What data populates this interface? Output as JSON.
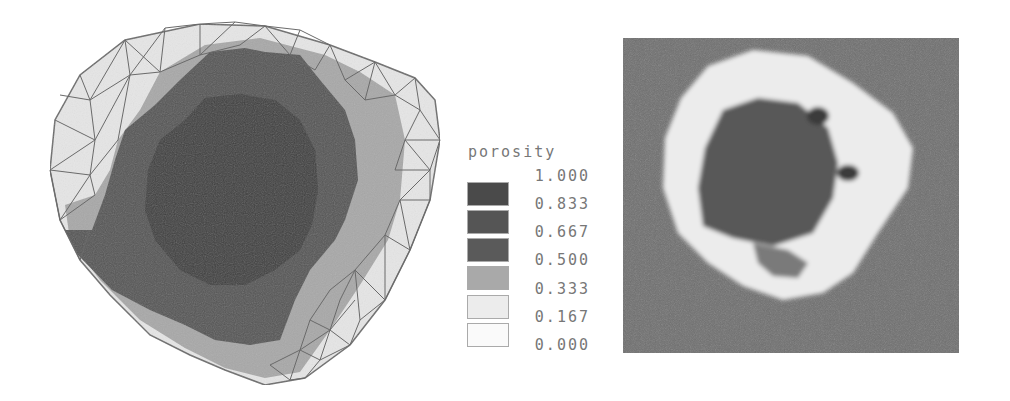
{
  "figure": {
    "left_panel": {
      "description": "Finite element mesh contour plot of porosity in a bone cross-section",
      "shades": {
        "core": "#3c3c3c",
        "inner": "#555555",
        "mid": "#a8a8a8",
        "outer": "#e6e6e6",
        "mesh_line": "#6a6a6a"
      }
    },
    "legend": {
      "title": "porosity",
      "labels": [
        "1.000",
        "0.833",
        "0.667",
        "0.500",
        "0.333",
        "0.167",
        "0.000"
      ],
      "swatches": [
        {
          "color": "#4a4a4a"
        },
        {
          "color": "#555555"
        },
        {
          "color": "#5a5a5a"
        },
        {
          "color": "#a9a9a9"
        },
        {
          "color": "#ececec"
        },
        {
          "color": "#fafafa"
        }
      ]
    },
    "right_panel": {
      "description": "CT scan image of bone cross-section",
      "shades": {
        "background": "#6e6e6e",
        "cortex": "#ececec",
        "marrow": "#585858",
        "holes": "#3a3a3a"
      }
    }
  }
}
